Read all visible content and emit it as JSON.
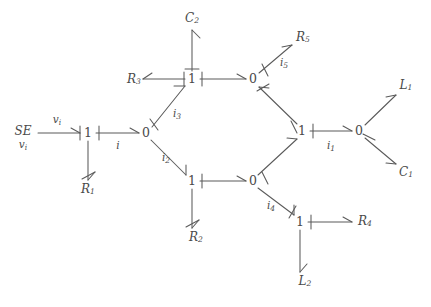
{
  "diagram": {
    "type": "bond-graph",
    "background_color": "#ffffff",
    "line_color": "#5a5a5a",
    "text_color": "#4a4a4a"
  },
  "source": {
    "name": "SE",
    "subscript": "v",
    "sub_subscript": "i",
    "label": "SE",
    "effort_label": "v",
    "effort_sub": "i"
  },
  "junctions": [
    {
      "id": "j1",
      "label": "1",
      "x": 88,
      "y": 133
    },
    {
      "id": "j2",
      "label": "0",
      "x": 146,
      "y": 133
    },
    {
      "id": "j3",
      "label": "1",
      "x": 192,
      "y": 79
    },
    {
      "id": "j4",
      "label": "0",
      "x": 253,
      "y": 79
    },
    {
      "id": "j5",
      "label": "1",
      "x": 192,
      "y": 181
    },
    {
      "id": "j6",
      "label": "0",
      "x": 253,
      "y": 181
    },
    {
      "id": "j7",
      "label": "1",
      "x": 302,
      "y": 131
    },
    {
      "id": "j8",
      "label": "0",
      "x": 359,
      "y": 131
    },
    {
      "id": "j9",
      "label": "1",
      "x": 300,
      "y": 222
    }
  ],
  "elements": [
    {
      "id": "R1",
      "base": "R",
      "sub": "1",
      "x": 88,
      "y": 188
    },
    {
      "id": "R2",
      "base": "R",
      "sub": "2",
      "x": 196,
      "y": 237
    },
    {
      "id": "R3",
      "base": "R",
      "sub": "3",
      "x": 134,
      "y": 79
    },
    {
      "id": "R4",
      "base": "R",
      "sub": "4",
      "x": 365,
      "y": 221
    },
    {
      "id": "R5",
      "base": "R",
      "sub": "5",
      "x": 303,
      "y": 37
    },
    {
      "id": "C1",
      "base": "C",
      "sub": "1",
      "x": 406,
      "y": 172
    },
    {
      "id": "C2",
      "base": "C",
      "sub": "2",
      "x": 192,
      "y": 18
    },
    {
      "id": "L1",
      "base": "L",
      "sub": "1",
      "x": 406,
      "y": 85
    },
    {
      "id": "L2",
      "base": "L",
      "sub": "2",
      "x": 305,
      "y": 281
    }
  ],
  "flow_labels": [
    {
      "id": "vi",
      "base": "v",
      "sub": "i",
      "x": 57,
      "y": 120
    },
    {
      "id": "i",
      "base": "i",
      "sub": "",
      "x": 118,
      "y": 146
    },
    {
      "id": "i1",
      "base": "i",
      "sub": "1",
      "x": 331,
      "y": 146
    },
    {
      "id": "i2",
      "base": "i",
      "sub": "2",
      "x": 166,
      "y": 158
    },
    {
      "id": "i3",
      "base": "i",
      "sub": "3",
      "x": 177,
      "y": 114
    },
    {
      "id": "i4",
      "base": "i",
      "sub": "4",
      "x": 271,
      "y": 206
    },
    {
      "id": "i5",
      "base": "i",
      "sub": "5",
      "x": 284,
      "y": 63
    }
  ],
  "bonds": [
    {
      "id": "b-se-j1",
      "from": "SE",
      "to": "j1",
      "flow": "vi"
    },
    {
      "id": "b-j1-j2",
      "from": "j1",
      "to": "j2",
      "flow": "i"
    },
    {
      "id": "b-j1-r1",
      "from": "j1",
      "to": "R1",
      "flow": ""
    },
    {
      "id": "b-j2-j3",
      "from": "j2",
      "to": "j3",
      "flow": "i3"
    },
    {
      "id": "b-j2-j5",
      "from": "j2",
      "to": "j5",
      "flow": "i2"
    },
    {
      "id": "b-j3-r3",
      "from": "j3",
      "to": "R3",
      "flow": ""
    },
    {
      "id": "b-j3-c2",
      "from": "j3",
      "to": "C2",
      "flow": ""
    },
    {
      "id": "b-j3-j4",
      "from": "j3",
      "to": "j4",
      "flow": ""
    },
    {
      "id": "b-j4-r5",
      "from": "j4",
      "to": "R5",
      "flow": "i5"
    },
    {
      "id": "b-j7-j4",
      "from": "j7",
      "to": "j4",
      "flow": ""
    },
    {
      "id": "b-j5-r2",
      "from": "j5",
      "to": "R2",
      "flow": ""
    },
    {
      "id": "b-j5-j6",
      "from": "j5",
      "to": "j6",
      "flow": ""
    },
    {
      "id": "b-j6-j7",
      "from": "j6",
      "to": "j7",
      "flow": ""
    },
    {
      "id": "b-j6-j9",
      "from": "j6",
      "to": "j9",
      "flow": "i4"
    },
    {
      "id": "b-j9-r4",
      "from": "j9",
      "to": "R4",
      "flow": ""
    },
    {
      "id": "b-j9-l2",
      "from": "j9",
      "to": "L2",
      "flow": ""
    },
    {
      "id": "b-j7-j8",
      "from": "j7",
      "to": "j8",
      "flow": "i1"
    },
    {
      "id": "b-j8-l1",
      "from": "j8",
      "to": "L1",
      "flow": ""
    },
    {
      "id": "b-j8-c1",
      "from": "j8",
      "to": "C1",
      "flow": ""
    }
  ]
}
